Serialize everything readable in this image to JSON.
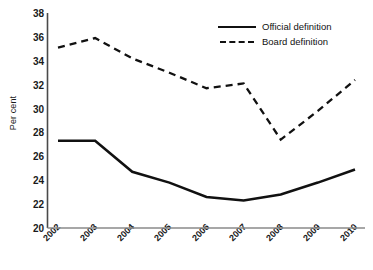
{
  "chart_data": {
    "type": "line",
    "title": "",
    "xlabel": "",
    "ylabel": "Per cent",
    "categories": [
      "2002",
      "2003",
      "2004",
      "2005",
      "2006",
      "2007",
      "2008",
      "2009",
      "2010"
    ],
    "yticks": [
      20,
      22,
      24,
      26,
      28,
      30,
      32,
      34,
      36,
      38
    ],
    "ylim": [
      20,
      38
    ],
    "grid": false,
    "legend_position": "top-right",
    "series": [
      {
        "name": "Official definition",
        "style": "solid",
        "color": "#111111",
        "values": [
          27.3,
          27.3,
          24.7,
          23.8,
          22.6,
          22.3,
          22.8,
          23.8,
          24.9
        ]
      },
      {
        "name": "Board definition",
        "style": "dashed",
        "color": "#111111",
        "values": [
          35.1,
          35.9,
          34.2,
          33.0,
          31.7,
          32.1,
          27.4,
          29.8,
          32.4
        ]
      }
    ]
  },
  "legend": {
    "items": [
      {
        "label": "Official definition",
        "style": "solid"
      },
      {
        "label": "Board definition",
        "style": "dashed"
      }
    ]
  }
}
